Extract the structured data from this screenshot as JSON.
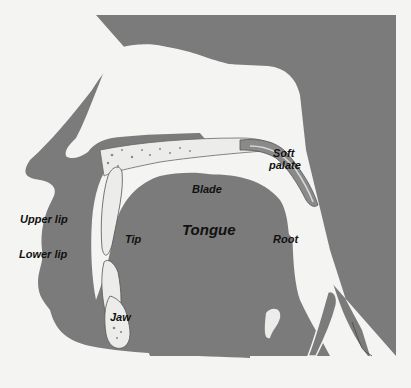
{
  "diagram": {
    "type": "anatomical-cross-section",
    "colors": {
      "background": "#f4f4f2",
      "tissue": "#7b7b7b",
      "bone": "#ececea",
      "outline": "#555555",
      "text": "#111111"
    },
    "labels": {
      "soft_palate_line1": "Soft",
      "soft_palate_line2": "palate",
      "blade": "Blade",
      "tongue": "Tongue",
      "tip": "Tip",
      "root": "Root",
      "upper_lip": "Upper lip",
      "lower_lip": "Lower lip",
      "jaw": "Jaw"
    }
  }
}
